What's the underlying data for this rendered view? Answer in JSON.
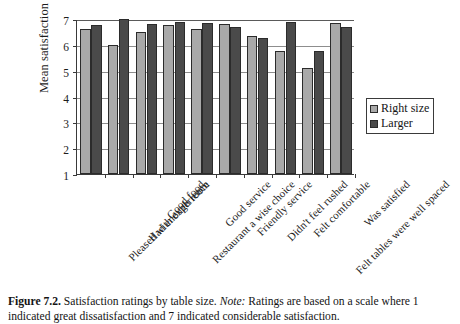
{
  "chart_data": {
    "type": "bar",
    "title": "",
    "xlabel": "",
    "ylabel": "Mean satisfaction ratings",
    "ylim": [
      1,
      7
    ],
    "yticks": [
      1,
      2,
      3,
      4,
      5,
      6,
      7
    ],
    "grid": true,
    "legend_position": "right",
    "categories": [
      "Pleased with experience",
      "Had enough room",
      "Good food",
      "Restaurant a wise choice",
      "Good service",
      "Friendly service",
      "Didn't feel rushed",
      "Felt comfortable",
      "Felt tables were well spaced",
      "Was satisfied"
    ],
    "series": [
      {
        "name": "Right size",
        "color": "#a9a9a9",
        "values": [
          6.6,
          6.0,
          6.5,
          6.75,
          6.6,
          6.8,
          6.35,
          5.75,
          5.1,
          6.85
        ]
      },
      {
        "name": "Larger",
        "color": "#4a4a4a",
        "values": [
          6.75,
          7.0,
          6.8,
          6.9,
          6.85,
          6.7,
          6.25,
          6.9,
          5.75,
          6.7
        ]
      }
    ]
  },
  "legend": {
    "entries": [
      {
        "label": "Right size"
      },
      {
        "label": "Larger"
      }
    ]
  },
  "caption": {
    "figure_number": "Figure 7.2.",
    "title_text": " Satisfaction ratings by table size. ",
    "note_word": "Note:",
    "note_text": " Ratings are based on a scale where",
    "line2": "1 indicated great dissatisfaction and 7 indicated considerable satisfaction."
  }
}
